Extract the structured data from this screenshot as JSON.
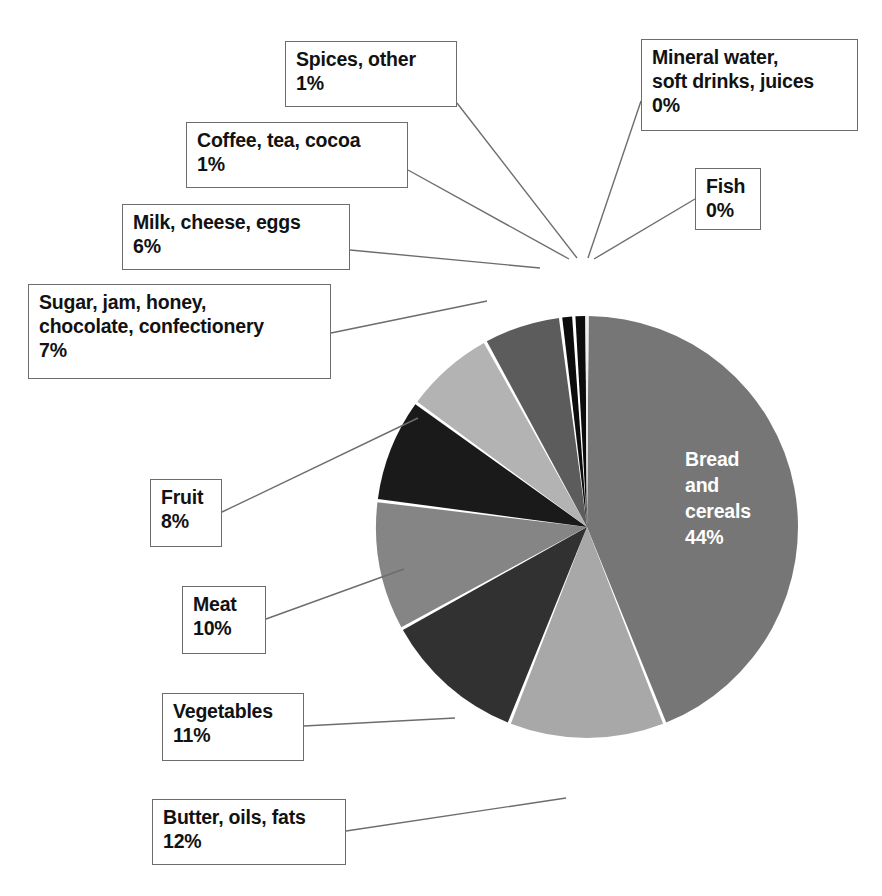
{
  "chart_data": {
    "type": "pie",
    "title": "",
    "subtitle": "",
    "xlabel": "",
    "ylabel": "",
    "legend_position": "callout-labels",
    "grid": false,
    "start_angle_deg": 0,
    "direction": "clockwise",
    "categories": [
      "Bread and cereals",
      "Butter, oils, fats",
      "Vegetables",
      "Meat",
      "Fruit",
      "Sugar, jam, honey, chocolate, confectionery",
      "Milk, cheese, eggs",
      "Coffee, tea, cocoa",
      "Spices, other",
      "Mineral water, soft drinks, juices",
      "Fish"
    ],
    "values": [
      44,
      12,
      11,
      10,
      8,
      7,
      6,
      1,
      1,
      0,
      0
    ],
    "value_labels": [
      "44%",
      "12%",
      "11%",
      "10%",
      "8%",
      "7%",
      "6%",
      "1%",
      "1%",
      "0%",
      "0%"
    ],
    "colors": [
      "#767676",
      "#a8a8a8",
      "#313131",
      "#858585",
      "#1a1a1a",
      "#b3b3b3",
      "#5c5c5c",
      "#0c0c0c",
      "#0c0c0c",
      "#d9d9d9",
      "#efefef"
    ]
  },
  "pie": {
    "center_x": 587,
    "center_y": 527,
    "radius": 211,
    "inner_label": {
      "text": "Bread\nand\ncereals\n44%",
      "color": "#ffffff"
    }
  },
  "callouts": [
    {
      "name": "spices-other",
      "text": "Spices, other\n1%",
      "box": {
        "x": 285,
        "y": 41,
        "w": 172,
        "h": 66
      },
      "leader": {
        "x1": 457,
        "y1": 103,
        "x2": 577,
        "y2": 258
      }
    },
    {
      "name": "coffee-tea-cocoa",
      "text": "Coffee, tea, cocoa\n1%",
      "box": {
        "x": 186,
        "y": 122,
        "w": 222,
        "h": 66
      },
      "leader": {
        "x1": 408,
        "y1": 170,
        "x2": 569,
        "y2": 259
      }
    },
    {
      "name": "milk-cheese-eggs",
      "text": "Milk, cheese, eggs\n6%",
      "box": {
        "x": 122,
        "y": 204,
        "w": 228,
        "h": 66
      },
      "leader": {
        "x1": 350,
        "y1": 250,
        "x2": 540,
        "y2": 268
      }
    },
    {
      "name": "sugar-jam-honey",
      "text": "Sugar, jam, honey,\nchocolate, confectionery\n7%",
      "box": {
        "x": 28,
        "y": 284,
        "w": 303,
        "h": 95
      },
      "leader": {
        "x1": 331,
        "y1": 333,
        "x2": 487,
        "y2": 301
      }
    },
    {
      "name": "fruit",
      "text": "Fruit\n8%",
      "box": {
        "x": 150,
        "y": 479,
        "w": 72,
        "h": 68
      },
      "leader": {
        "x1": 222,
        "y1": 512,
        "x2": 418,
        "y2": 418
      }
    },
    {
      "name": "meat",
      "text": "Meat\n10%",
      "box": {
        "x": 182,
        "y": 586,
        "w": 84,
        "h": 68
      },
      "leader": {
        "x1": 266,
        "y1": 619,
        "x2": 404,
        "y2": 569
      }
    },
    {
      "name": "vegetables",
      "text": "Vegetables\n11%",
      "box": {
        "x": 162,
        "y": 693,
        "w": 142,
        "h": 68
      },
      "leader": {
        "x1": 304,
        "y1": 726,
        "x2": 455,
        "y2": 718
      }
    },
    {
      "name": "butter-oils-fats",
      "text": "Butter, oils, fats\n12%",
      "box": {
        "x": 152,
        "y": 799,
        "w": 194,
        "h": 66
      },
      "leader": {
        "x1": 346,
        "y1": 831,
        "x2": 566,
        "y2": 798
      }
    },
    {
      "name": "mineral-water",
      "text": "Mineral water,\nsoft drinks, juices\n0%",
      "box": {
        "x": 641,
        "y": 39,
        "w": 217,
        "h": 92
      },
      "leader": {
        "x1": 641,
        "y1": 101,
        "x2": 588,
        "y2": 258
      }
    },
    {
      "name": "fish",
      "text": "Fish\n0%",
      "box": {
        "x": 695,
        "y": 168,
        "w": 66,
        "h": 62
      },
      "leader": {
        "x1": 695,
        "y1": 199,
        "x2": 594,
        "y2": 259
      }
    }
  ]
}
